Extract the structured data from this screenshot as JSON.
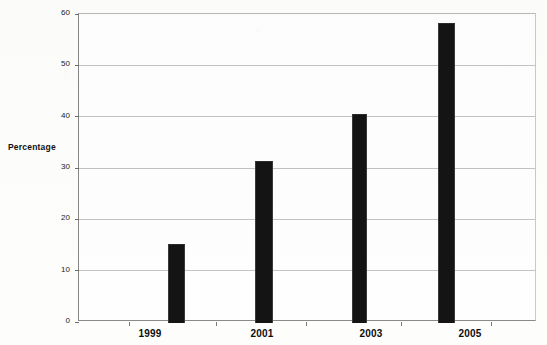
{
  "chart_data": {
    "type": "bar",
    "title": "",
    "xlabel": "",
    "ylabel": "Percentage",
    "categories": [
      "1999",
      "2001",
      "2003",
      "2005"
    ],
    "values": [
      15.2,
      31.4,
      40.5,
      58.3
    ],
    "ylim": [
      0,
      60
    ],
    "ytick_labels": [
      "0",
      "10",
      "20",
      "30",
      "40",
      "50",
      "60"
    ],
    "ytick_values": [
      0,
      10,
      20,
      30,
      40,
      50,
      60
    ],
    "xtick_labels": [
      "1999",
      "2001",
      "2003",
      "2005"
    ],
    "grid": true,
    "legend": "none",
    "bar_color": "#141414",
    "grid_color": "#c2c2c2",
    "axis_color": "#868686",
    "background_color": "#fdfdfc"
  },
  "axis": {
    "y_title": "Percentage"
  }
}
